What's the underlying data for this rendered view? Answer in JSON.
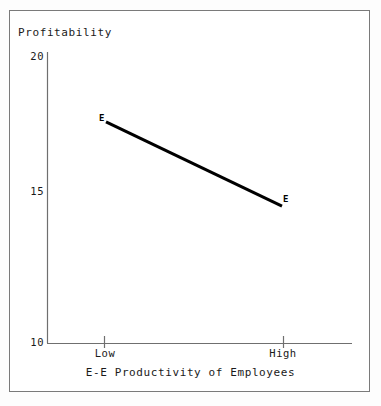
{
  "chart_data": {
    "type": "line",
    "title": "",
    "xlabel": "E-E Productivity of Employees",
    "ylabel": "Profitability",
    "categories": [
      "Low",
      "High"
    ],
    "x": [
      0,
      1
    ],
    "xtick_labels": [
      "Low",
      "High"
    ],
    "ytick_labels": [
      "10",
      "15",
      "20"
    ],
    "yticks": [
      10,
      15,
      20
    ],
    "ylim": [
      10,
      20
    ],
    "grid": false,
    "legend": "none",
    "series": [
      {
        "name": "E",
        "values": [
          17.6,
          14.7
        ],
        "point_labels": [
          "E",
          "E"
        ],
        "color": "#000000",
        "line_width": 3
      }
    ],
    "annotations": [
      {
        "text": "E",
        "at": "Low"
      },
      {
        "text": "E",
        "at": "High"
      }
    ]
  },
  "labels": {
    "y_axis_title": "Profitability",
    "x_axis_title": "E-E Productivity of Employees",
    "y_tick_top": "20",
    "y_tick_mid": "15",
    "y_tick_bottom": "10",
    "x_tick_left": "Low",
    "x_tick_right": "High",
    "point_label_left": "E",
    "point_label_right": "E"
  },
  "colors": {
    "line": "#000000",
    "axis": "#6f6f6f",
    "frame": "#7a7a7a",
    "background": "#ffffff",
    "text": "#1a1a1a"
  }
}
